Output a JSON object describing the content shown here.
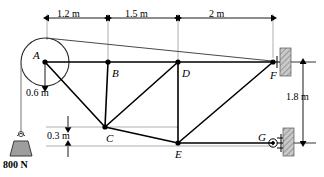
{
  "figure": {
    "type": "statics-truss-free-body-diagram",
    "background_color": "#ffffff",
    "line_color": "#000000",
    "hatch_color": "#b0b0b0"
  },
  "joints": [
    {
      "id": "A",
      "label": "A",
      "x": 45,
      "y": 62,
      "label_dx": -12,
      "label_dy": -4
    },
    {
      "id": "B",
      "label": "B",
      "x": 108,
      "y": 62,
      "label_dx": 4,
      "label_dy": 12
    },
    {
      "id": "C",
      "label": "C",
      "x": 105,
      "y": 127,
      "label_dx": 2,
      "label_dy": 13
    },
    {
      "id": "D",
      "label": "D",
      "x": 178,
      "y": 62,
      "label_dx": 4,
      "label_dy": 12
    },
    {
      "id": "E",
      "label": "E",
      "x": 178,
      "y": 143,
      "label_dx": 1,
      "label_dy": 13
    },
    {
      "id": "F",
      "label": "F",
      "x": 273,
      "y": 62,
      "label_dx": -1,
      "label_dy": 14
    },
    {
      "id": "G",
      "label": "G",
      "x": 273,
      "y": 143,
      "label_dx": -12,
      "label_dy": -2
    }
  ],
  "members": [
    {
      "from": "A",
      "to": "B"
    },
    {
      "from": "B",
      "to": "D"
    },
    {
      "from": "D",
      "to": "F"
    },
    {
      "from": "A",
      "to": "C"
    },
    {
      "from": "B",
      "to": "C"
    },
    {
      "from": "C",
      "to": "D"
    },
    {
      "from": "C",
      "to": "E"
    },
    {
      "from": "D",
      "to": "E"
    },
    {
      "from": "E",
      "to": "F"
    },
    {
      "from": "E",
      "to": "G"
    }
  ],
  "pulley": {
    "center_x": 45,
    "center_y": 62,
    "radius": 24,
    "radius_dim_label": "0.6 m",
    "radius_dim_label_x": 30,
    "radius_dim_label_y": 90
  },
  "cable": {
    "tangent_top_x": 47,
    "tangent_top_y": 38,
    "to_joint": "F",
    "hang_x": 21,
    "hang_top_y": 62,
    "hang_bottom_y": 134
  },
  "load": {
    "label": "800 N",
    "label_x": 6,
    "label_y": 162,
    "weight_x": 21,
    "weight_top_y": 134,
    "weight_bottom_y": 155
  },
  "dimensions": {
    "horizontal": [
      {
        "label": "1.2 m",
        "from_x": 47,
        "to_x": 108,
        "y": 18,
        "label_x": 58,
        "label_y": 14
      },
      {
        "label": "1.5 m",
        "from_x": 108,
        "to_x": 178,
        "y": 18,
        "label_x": 126,
        "label_y": 14
      },
      {
        "label": "2 m",
        "from_x": 178,
        "to_x": 273,
        "y": 18,
        "label_x": 212,
        "label_y": 14
      }
    ],
    "vertical": [
      {
        "label": "1.8 m",
        "x": 303,
        "from_y": 62,
        "to_y": 143,
        "label_x": 288,
        "label_y": 97
      },
      {
        "label": "0.3 m",
        "x": 68,
        "from_y": 127,
        "to_y": 146,
        "label_x": 52,
        "label_y": 130
      }
    ]
  },
  "supports": [
    {
      "type": "pin-wall",
      "at_joint": "F",
      "wall_x": 280,
      "wall_y": 48,
      "wall_w": 11,
      "wall_h": 28
    },
    {
      "type": "roller-wall",
      "at_joint": "G",
      "wall_x": 283,
      "wall_y": 128,
      "wall_w": 11,
      "wall_h": 28
    }
  ],
  "extension_lines": [
    {
      "x": 47,
      "from_y": 18,
      "to_y": 40
    },
    {
      "x": 108,
      "from_y": 18,
      "to_y": 60
    },
    {
      "x": 178,
      "from_y": 18,
      "to_y": 60
    },
    {
      "x": 273,
      "from_y": 18,
      "to_y": 58
    }
  ]
}
